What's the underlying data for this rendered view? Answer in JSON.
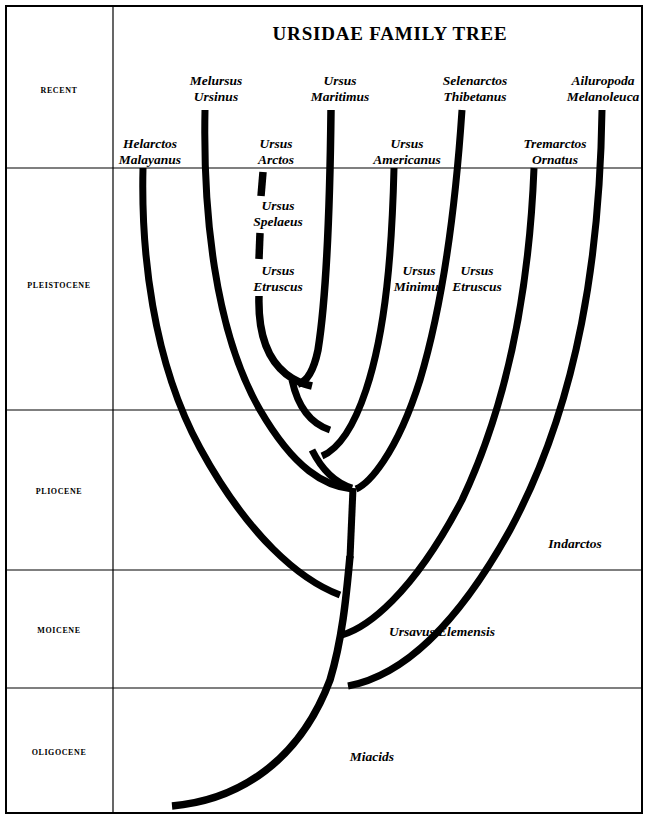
{
  "document": {
    "title": "URSIDAE FAMILY TREE",
    "title_x": 390,
    "title_y": 34,
    "width": 648,
    "height": 819,
    "background_color": "#ffffff",
    "line_color": "#000000",
    "border_color": "#000000"
  },
  "layout": {
    "border": {
      "x": 6,
      "y": 6,
      "width": 636,
      "height": 807,
      "stroke_width": 2
    },
    "vertical_divider_x": 113,
    "epoch_boundaries_y": [
      6,
      168,
      410,
      570,
      688,
      813
    ],
    "grid_stroke_width": 1.2
  },
  "epochs": [
    {
      "id": "recent",
      "label": "RECENT",
      "label_x": 59,
      "label_y": 90,
      "top_y": 6,
      "bottom_y": 168
    },
    {
      "id": "pleistocene",
      "label": "PLEISTOCENE",
      "label_x": 59,
      "label_y": 285,
      "top_y": 168,
      "bottom_y": 410
    },
    {
      "id": "pliocene",
      "label": "PLIOCENE",
      "label_x": 59,
      "label_y": 491,
      "top_y": 410,
      "bottom_y": 570
    },
    {
      "id": "moicene",
      "label": "MOICENE",
      "label_x": 59,
      "label_y": 630,
      "top_y": 570,
      "bottom_y": 688
    },
    {
      "id": "oligocene",
      "label": "OLIGOCENE",
      "label_x": 59,
      "label_y": 752,
      "top_y": 688,
      "bottom_y": 813
    }
  ],
  "taxa": [
    {
      "id": "helarctos-malayanus",
      "lines": [
        "Helarctos",
        "Malayanus"
      ],
      "label_x": 150,
      "label_y": 152,
      "extinct": false,
      "epoch": "recent"
    },
    {
      "id": "melursus-ursinus",
      "lines": [
        "Melursus",
        "Ursinus"
      ],
      "label_x": 216,
      "label_y": 89,
      "extinct": false,
      "epoch": "recent"
    },
    {
      "id": "ursus-arctos",
      "lines": [
        "Ursus",
        "Arctos"
      ],
      "label_x": 276,
      "label_y": 152,
      "extinct": false,
      "epoch": "recent"
    },
    {
      "id": "ursus-maritimus",
      "lines": [
        "Ursus",
        "Maritimus"
      ],
      "label_x": 340,
      "label_y": 89,
      "extinct": false,
      "epoch": "recent"
    },
    {
      "id": "ursus-americanus",
      "lines": [
        "Ursus",
        "Americanus"
      ],
      "label_x": 407,
      "label_y": 152,
      "extinct": false,
      "epoch": "recent"
    },
    {
      "id": "selenarctos-thibetanus",
      "lines": [
        "Selenarctos",
        "Thibetanus"
      ],
      "label_x": 475,
      "label_y": 89,
      "extinct": false,
      "epoch": "recent"
    },
    {
      "id": "tremarctos-ornatus",
      "lines": [
        "Tremarctos",
        "Ornatus"
      ],
      "label_x": 555,
      "label_y": 152,
      "extinct": false,
      "epoch": "recent"
    },
    {
      "id": "ailuropoda-melanoleuca",
      "lines": [
        "Ailuropoda",
        "Melanoleuca"
      ],
      "label_x": 603,
      "label_y": 89,
      "extinct": false,
      "epoch": "recent"
    },
    {
      "id": "ursus-spelaeus",
      "lines": [
        "Ursus",
        "Spelaeus"
      ],
      "label_x": 278,
      "label_y": 214,
      "extinct": true,
      "epoch": "pleistocene"
    },
    {
      "id": "ursus-etruscus-left",
      "lines": [
        "Ursus",
        "Etruscus"
      ],
      "label_x": 278,
      "label_y": 279,
      "extinct": true,
      "epoch": "pleistocene"
    },
    {
      "id": "ursus-minimus",
      "lines": [
        "Ursus",
        "Minimus"
      ],
      "label_x": 419,
      "label_y": 279,
      "extinct": true,
      "epoch": "pleistocene"
    },
    {
      "id": "ursus-etruscus-right",
      "lines": [
        "Ursus",
        "Etruscus"
      ],
      "label_x": 477,
      "label_y": 279,
      "extinct": true,
      "epoch": "pleistocene"
    },
    {
      "id": "indarctos",
      "lines": [
        "Indarctos"
      ],
      "label_x": 575,
      "label_y": 544,
      "extinct": true,
      "epoch": "pliocene"
    },
    {
      "id": "ursavus-elemensis",
      "lines": [
        "Ursavus Elemensis"
      ],
      "label_x": 442,
      "label_y": 632,
      "extinct": true,
      "epoch": "moicene"
    },
    {
      "id": "miacids",
      "lines": [
        "Miacids"
      ],
      "label_x": 372,
      "label_y": 757,
      "extinct": true,
      "epoch": "oligocene"
    }
  ],
  "branches": [
    {
      "id": "branch-helarctos-malayanus",
      "taxon": "helarctos-malayanus",
      "path": "M 143,168 C 141,250 152,360 200,448 C 248,536 300,580 340,595",
      "stroke_width": 7,
      "dashed": false
    },
    {
      "id": "branch-melursus-ursinus",
      "taxon": "melursus-ursinus",
      "path": "M 205,110 C 203,210 214,330 260,410 C 295,470 325,486 352,489",
      "stroke_width": 7,
      "dashed": false
    },
    {
      "id": "branch-ursus-arctos-tip",
      "taxon": "ursus-arctos",
      "path": "M 263,172 L 261,196",
      "stroke_width": 7.5,
      "dashed": false
    },
    {
      "id": "branch-ursus-spelaeus-seg",
      "taxon": "ursus-spelaeus",
      "path": "M 260,233 L 259,259",
      "stroke_width": 7.5,
      "dashed": false
    },
    {
      "id": "branch-ursus-etruscus-left",
      "taxon": "ursus-etruscus-left",
      "path": "M 259,296 C 258,330 266,358 286,374 C 296,382 304,384 312,386",
      "stroke_width": 7.5,
      "dashed": false
    },
    {
      "id": "branch-ursus-maritimus",
      "taxon": "ursus-maritimus",
      "path": "M 331,110 C 330,200 326,300 318,350 C 313,374 306,382 298,384",
      "stroke_width": 7.5,
      "dashed": false
    },
    {
      "id": "branch-node-arctos-maritimus",
      "taxon": null,
      "path": "M 292,380 C 298,408 312,424 330,430",
      "stroke_width": 7,
      "dashed": false
    },
    {
      "id": "branch-ursus-americanus",
      "taxon": "ursus-americanus",
      "path": "M 394,168 C 392,250 386,330 366,390 C 352,432 336,450 322,456",
      "stroke_width": 7,
      "dashed": false
    },
    {
      "id": "branch-node-americanus",
      "taxon": null,
      "path": "M 312,450 C 322,470 336,483 352,488",
      "stroke_width": 7,
      "dashed": false
    },
    {
      "id": "branch-selenarctos-thibetanus",
      "taxon": "selenarctos-thibetanus",
      "path": "M 462,110 C 456,200 444,300 420,380 C 396,456 368,484 356,489",
      "stroke_width": 7,
      "dashed": false
    },
    {
      "id": "branch-pliocene-stem",
      "taxon": null,
      "path": "M 353,488 L 350,558",
      "stroke_width": 7,
      "dashed": false
    },
    {
      "id": "branch-tremarctos-ornatus",
      "taxon": "tremarctos-ornatus",
      "path": "M 534,168 C 530,270 514,390 462,500 C 412,596 366,628 342,635",
      "stroke_width": 7,
      "dashed": false
    },
    {
      "id": "branch-indarctos-ailuropoda",
      "taxon": "ailuropoda-melanoleuca",
      "path": "M 602,110 C 600,250 580,400 510,530 C 440,656 380,680 348,686",
      "stroke_width": 7,
      "dashed": false
    },
    {
      "id": "branch-ursavus-trunk",
      "taxon": "ursavus-elemensis",
      "path": "M 350,556 C 346,600 342,640 330,680 C 300,760 240,800 172,806",
      "stroke_width": 7.5,
      "dashed": false
    }
  ]
}
